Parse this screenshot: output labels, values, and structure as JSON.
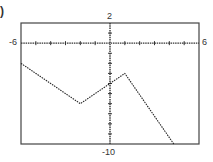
{
  "panel_label": ")",
  "chart_data": {
    "type": "line",
    "title": "",
    "xlabel": "",
    "ylabel": "",
    "xlim": [
      -6,
      6
    ],
    "ylim": [
      -10,
      2
    ],
    "grid": false,
    "axis_labels": {
      "xmin": "-6",
      "xmax": "6",
      "ymax": "2",
      "ymin": "-10"
    },
    "series": [
      {
        "name": "f(x)",
        "x": [
          -6,
          -2,
          0,
          1,
          4.3
        ],
        "y": [
          -2,
          -6,
          -4,
          -3,
          -10
        ]
      }
    ],
    "x_ticks": [
      -5,
      -4,
      -3,
      -2,
      -1,
      1,
      2,
      3,
      4,
      5
    ],
    "y_ticks": [
      1,
      -1,
      -2,
      -3,
      -4,
      -5,
      -6,
      -7,
      -8,
      -9
    ]
  }
}
